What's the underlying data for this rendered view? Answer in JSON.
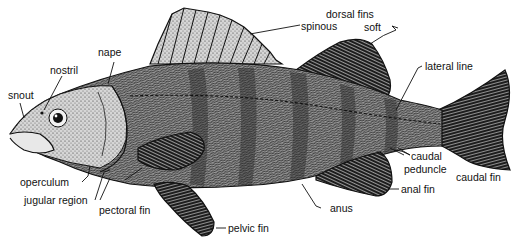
{
  "figure": {
    "labels": {
      "snout": "snout",
      "nostril": "nostril",
      "nape": "nape",
      "dorsal_fins": "dorsal fins",
      "spinous": "spinous",
      "soft": "soft",
      "lateral_line": "lateral line",
      "caudal_peduncle_1": "caudal",
      "caudal_peduncle_2": "peduncle",
      "caudal_fin": "caudal fin",
      "anal_fin": "anal fin",
      "anus": "anus",
      "pelvic_fin": "pelvic fin",
      "pectoral_fin": "pectoral fin",
      "jugular_region": "jugular region",
      "operculum": "operculum"
    },
    "colors": {
      "ink": "#111111",
      "body_fill": "#8a8a8a",
      "head_fill": "#c9c9c9",
      "fin_dark": "#222222",
      "spiny_fin": "#bdbdbd",
      "background": "#ffffff"
    }
  }
}
